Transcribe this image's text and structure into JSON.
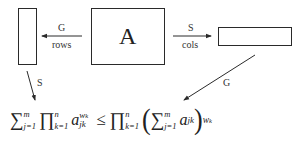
{
  "diagram": {
    "matrix_label": "A",
    "left_arrow": {
      "top_label": "G",
      "bottom_label": "rows"
    },
    "right_arrow": {
      "top_label": "S",
      "bottom_label": "cols"
    },
    "down_left_arrow": {
      "label": "S"
    },
    "down_right_arrow": {
      "label": "G"
    },
    "formula": {
      "lhs_sum": "∑",
      "lhs_sum_sup": "m",
      "lhs_sum_sub": "j=1",
      "lhs_prod": "∏",
      "lhs_prod_sup": "n",
      "lhs_prod_sub": "k=1",
      "lhs_var": "a",
      "lhs_var_sub": "jk",
      "lhs_var_pow": "w_k",
      "lhs_var_pow_base": "w",
      "lhs_var_pow_sub": "k",
      "relation": "≤",
      "rhs_prod": "∏",
      "rhs_prod_sup": "n",
      "rhs_prod_sub": "k=1",
      "open_paren": "(",
      "rhs_sum": "∑",
      "rhs_sum_sup": "m",
      "rhs_sum_sub": "j=1",
      "rhs_var": "a",
      "rhs_var_sub": "jk",
      "close_paren": ")",
      "rhs_pow_base": "w",
      "rhs_pow_sub": "k"
    }
  },
  "colors": {
    "stroke": "#2a2a2a",
    "text": "#222222",
    "background": "#ffffff"
  }
}
